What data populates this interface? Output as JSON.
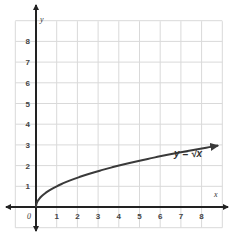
{
  "chart_data": {
    "type": "line",
    "title": "",
    "xlabel": "x",
    "ylabel": "y",
    "xlim": [
      -1,
      9
    ],
    "ylim": [
      -1,
      9
    ],
    "grid": true,
    "x_ticks": [
      "0",
      "1",
      "2",
      "3",
      "4",
      "5",
      "6",
      "7",
      "8"
    ],
    "y_ticks": [
      "1",
      "2",
      "3",
      "4",
      "5",
      "6",
      "7",
      "8"
    ],
    "origin_label": "0",
    "series": [
      {
        "name": "y = √x",
        "x": [
          0,
          0.25,
          0.5,
          1,
          2,
          3,
          4,
          5,
          6,
          7,
          8,
          8.8
        ],
        "y": [
          0,
          0.5,
          0.71,
          1,
          1.41,
          1.73,
          2,
          2.24,
          2.45,
          2.65,
          2.83,
          2.97
        ]
      }
    ],
    "annotations": [
      {
        "text": "y = √x",
        "x": 7.0,
        "y": 3.4
      }
    ],
    "colors": {
      "grid": "#d9d9d9",
      "axis": "#222222",
      "curve": "#3a3a3a"
    }
  }
}
